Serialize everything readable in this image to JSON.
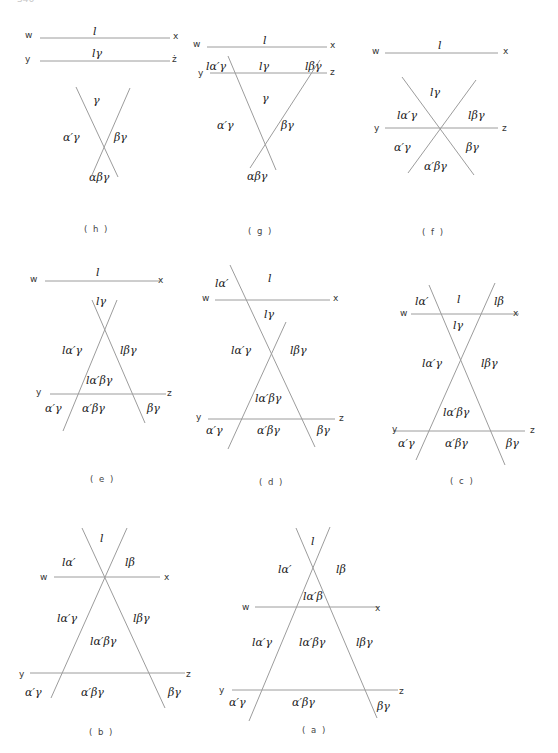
{
  "header": {
    "page_number": "346",
    "running_title": ""
  },
  "diagrams": {
    "h": {
      "caption": "( h )",
      "points": {
        "w": "w",
        "x": "x",
        "y": "y",
        "z": "ż"
      },
      "regions": [
        "l",
        "lγ",
        "γ",
        "α′γ",
        "βγ",
        "αβγ"
      ]
    },
    "g": {
      "caption": "( g )",
      "points": {
        "w": "w",
        "x": "x",
        "y": "y",
        "z": "z"
      },
      "regions": [
        "l",
        "lα′γ",
        "lγ",
        "lβγ",
        "γ",
        "α′γ",
        "βγ",
        "αβγ"
      ]
    },
    "f": {
      "caption": "( f )",
      "points": {
        "w": "w",
        "x": "x",
        "y": "y",
        "z": "z"
      },
      "regions": [
        "l",
        "lγ",
        "lα′γ",
        "lβγ",
        "α′γ",
        "βγ",
        "α′βγ"
      ]
    },
    "e": {
      "caption": "( e )",
      "points": {
        "w": "w",
        "x": "x",
        "y": "y",
        "z": "z"
      },
      "regions": [
        "l",
        "lγ",
        "lα′γ",
        "lβγ",
        "lα′βγ",
        "α′γ",
        "α′βγ",
        "βγ"
      ]
    },
    "d": {
      "caption": "( d )",
      "points": {
        "w": "w",
        "x": "x",
        "y": "y",
        "z": "z"
      },
      "regions": [
        "lα′",
        "l",
        "lγ",
        "lα′γ",
        "lβγ",
        "lα′βγ",
        "α′γ",
        "α′βγ",
        "βγ"
      ]
    },
    "c": {
      "caption": "( c )",
      "points": {
        "w": "w",
        "x": "x",
        "y": "y",
        "z": "z"
      },
      "regions": [
        "lα′",
        "l",
        "lβ",
        "lγ",
        "lα′γ",
        "lβγ",
        "lα′βγ",
        "α′γ",
        "α′βγ",
        "βγ"
      ]
    },
    "b": {
      "caption": "( b )",
      "points": {
        "w": "w",
        "x": "x",
        "y": "y",
        "z": "z"
      },
      "regions": [
        "l",
        "lα′",
        "lβ",
        "lα′γ",
        "lβγ",
        "lα′βγ",
        "α′γ",
        "α′βγ",
        "βγ"
      ]
    },
    "a": {
      "caption": "( a )",
      "points": {
        "w": "w",
        "x": "x",
        "y": "y",
        "z": "z"
      },
      "regions": [
        "l",
        "lα′",
        "lβ",
        "lα′β",
        "lα′γ",
        "lα′βγ",
        "lβγ",
        "α′γ",
        "α′βγ",
        "βγ"
      ]
    }
  }
}
